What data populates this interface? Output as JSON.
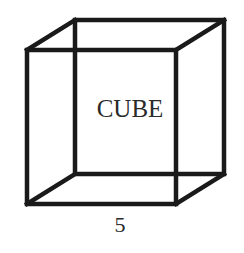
{
  "diagram": {
    "shape": "cube",
    "label": "CUBE",
    "side_length_label": "5",
    "stroke_color": "#1a1a1a"
  }
}
